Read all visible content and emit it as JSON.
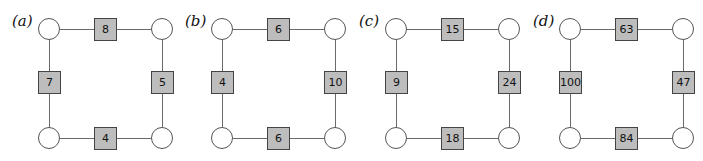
{
  "figure": {
    "panels": [
      {
        "label": "(a)",
        "weights": {
          "top": "8",
          "left": "7",
          "right": "5",
          "bottom": "4"
        }
      },
      {
        "label": "(b)",
        "weights": {
          "top": "6",
          "left": "4",
          "right": "10",
          "bottom": "6"
        }
      },
      {
        "label": "(c)",
        "weights": {
          "top": "15",
          "left": "9",
          "right": "24",
          "bottom": "18"
        }
      },
      {
        "label": "(d)",
        "weights": {
          "top": "63",
          "left": "100",
          "right": "47",
          "bottom": "84"
        }
      }
    ],
    "colors": {
      "weight_fill": "#bdbdbd",
      "edge": "#6a6a6a",
      "node_fill": "#ffffff"
    }
  }
}
